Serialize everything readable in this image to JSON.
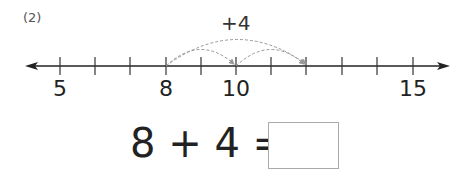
{
  "problem": {
    "number_label": "(2)",
    "operation_label": "+4",
    "equation_text": "8 + 4 =",
    "answer_value": ""
  },
  "number_line": {
    "start": 5,
    "end": 15,
    "labels": [
      {
        "value": 5,
        "text": "5"
      },
      {
        "value": 8,
        "text": "8"
      },
      {
        "value": 10,
        "text": "10"
      },
      {
        "value": 15,
        "text": "15"
      }
    ],
    "jumps": [
      {
        "from": 8,
        "to": 12,
        "style": "dashed"
      },
      {
        "from": 8,
        "to": 10,
        "style": "dashed"
      },
      {
        "from": 10,
        "to": 12,
        "style": "dashed"
      }
    ]
  },
  "colors": {
    "axis": "#222222",
    "arc": "#999999",
    "box_border": "#aaaaaa"
  }
}
